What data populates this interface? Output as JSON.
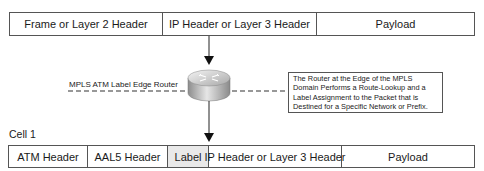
{
  "top_packet": {
    "fields": [
      {
        "label": "Frame or Layer 2 Header"
      },
      {
        "label": "IP Header or Layer 3 Header"
      },
      {
        "label": "Payload"
      }
    ]
  },
  "router": {
    "label": "MPLS ATM Label Edge Router",
    "icon": "router-icon"
  },
  "callout": {
    "lines": [
      "The Router at the Edge of the MPLS",
      "Domain Performs a Route-Lookup and a",
      "Label Assignment to the Packet that is",
      "Destined for a Specific Network or Prefix."
    ]
  },
  "cell": {
    "title": "Cell 1",
    "fields": [
      {
        "label": "ATM Header"
      },
      {
        "label": "AAL5 Header"
      },
      {
        "label": "Label",
        "highlight": "#e9e9e9"
      },
      {
        "label": "IP Header or Layer 3 Header"
      },
      {
        "label": "Payload"
      }
    ]
  },
  "colors": {
    "line": "#333333",
    "label_fill": "#e9e9e9",
    "router_body": "#b5b5b5"
  }
}
